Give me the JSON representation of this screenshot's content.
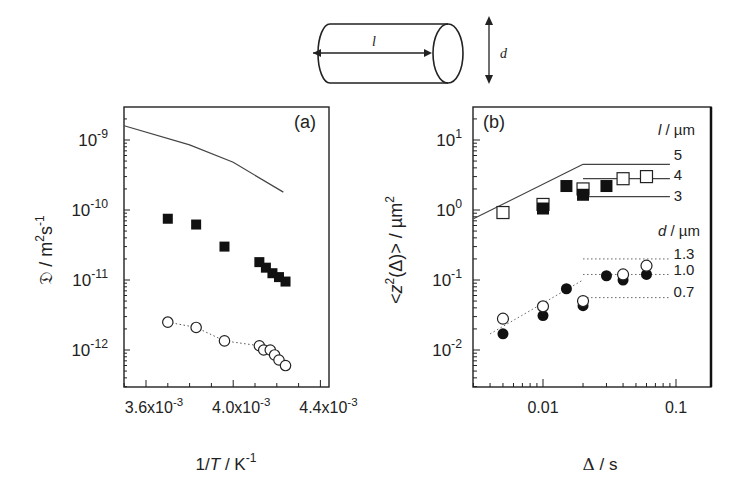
{
  "figure": {
    "schematic": {
      "length_label": "l",
      "diameter_label": "d"
    },
    "panel_a": {
      "label": "(a)",
      "ylabel_symbol": "𝔇",
      "ylabel_unit": "/ m²s⁻¹",
      "xlabel": "1/T / K⁻¹",
      "yticks": [
        "10-9",
        "10-10",
        "10-11",
        "10-12"
      ],
      "xticks": [
        "3.6x10-3",
        "4.0x10-3",
        "4.4x10-3"
      ]
    },
    "panel_b": {
      "label": "(b)",
      "ylabel": "<z²(Δ)> / µm²",
      "xlabel": "Δ / s",
      "yticks": [
        "10^1",
        "10^0",
        "10^-1",
        "10^-2"
      ],
      "xticks": [
        "0.01",
        "0.1"
      ],
      "legend_l_title": "l / µm",
      "legend_l_values": [
        "5",
        "4",
        "3"
      ],
      "legend_d_title": "d / µm",
      "legend_d_values": [
        "1.3",
        "1.0",
        "0.7"
      ]
    }
  },
  "chart_data": [
    {
      "type": "scatter",
      "title": "(a)",
      "xlabel": "1/T / K^-1",
      "ylabel": "D / m^2 s^-1",
      "xscale": "linear",
      "yscale": "log",
      "xlim": [
        0.0035,
        0.00443
      ],
      "ylim": [
        3e-13,
        3e-09
      ],
      "xticks": [
        0.0036,
        0.004,
        0.0044
      ],
      "yticks": [
        1e-09,
        1e-10,
        1e-11,
        1e-12
      ],
      "series": [
        {
          "name": "theory (solid line)",
          "style": "line",
          "x": [
            0.0035,
            0.0038,
            0.004,
            0.00423
          ],
          "y": [
            1.6e-09,
            8.5e-10,
            4.8e-10,
            1.8e-10
          ]
        },
        {
          "name": "filled squares",
          "style": "filled-square",
          "x": [
            0.0037,
            0.00383,
            0.00396,
            0.00412,
            0.00415,
            0.00418,
            0.00421,
            0.00424
          ],
          "y": [
            7.5e-11,
            6.2e-11,
            3e-11,
            1.8e-11,
            1.5e-11,
            1.25e-11,
            1.1e-11,
            9.5e-12
          ]
        },
        {
          "name": "open circles (dotted fit)",
          "style": "open-circle",
          "x": [
            0.0037,
            0.00383,
            0.00396,
            0.00412,
            0.00414,
            0.00417,
            0.00419,
            0.00421,
            0.00424
          ],
          "y": [
            2.5e-12,
            2.1e-12,
            1.35e-12,
            1.15e-12,
            1e-12,
            1e-12,
            8.5e-13,
            7.2e-13,
            6e-13
          ]
        }
      ]
    },
    {
      "type": "scatter",
      "title": "(b)",
      "xlabel": "Δ / s",
      "ylabel": "<z^2(Δ)> / µm^2",
      "xscale": "log",
      "yscale": "log",
      "xlim": [
        0.003,
        0.18
      ],
      "ylim": [
        0.0035,
        30
      ],
      "xticks": [
        0.01,
        0.1
      ],
      "yticks": [
        10,
        1,
        0.1,
        0.01
      ],
      "series": [
        {
          "name": "open squares",
          "style": "open-square",
          "x": [
            0.005,
            0.01,
            0.02,
            0.04,
            0.06
          ],
          "y": [
            0.92,
            1.2,
            2.0,
            2.8,
            3.0
          ]
        },
        {
          "name": "filled squares",
          "style": "filled-square",
          "x": [
            0.01,
            0.015,
            0.02,
            0.03
          ],
          "y": [
            1.05,
            2.2,
            1.65,
            2.2
          ]
        },
        {
          "name": "open circles",
          "style": "open-circle",
          "x": [
            0.005,
            0.01,
            0.02,
            0.04,
            0.06
          ],
          "y": [
            0.028,
            0.042,
            0.05,
            0.12,
            0.16
          ]
        },
        {
          "name": "filled circles",
          "style": "filled-circle",
          "x": [
            0.005,
            0.01,
            0.015,
            0.02,
            0.03,
            0.04,
            0.06
          ],
          "y": [
            0.017,
            0.031,
            0.075,
            0.043,
            0.115,
            0.1,
            0.12
          ]
        },
        {
          "name": "theory l (solid)",
          "style": "line",
          "x": [
            0.003,
            0.02
          ],
          "y": [
            0.75,
            4.5
          ]
        },
        {
          "name": "l = 5 µm plateau",
          "style": "line",
          "x": [
            0.02,
            0.09
          ],
          "y": [
            4.5,
            4.5
          ]
        },
        {
          "name": "l = 4 µm plateau",
          "style": "line",
          "x": [
            0.02,
            0.09
          ],
          "y": [
            2.8,
            2.8
          ]
        },
        {
          "name": "l = 3 µm plateau",
          "style": "line",
          "x": [
            0.02,
            0.09
          ],
          "y": [
            1.55,
            1.55
          ]
        },
        {
          "name": "theory d (dotted)",
          "style": "dotted",
          "x": [
            0.004,
            0.02
          ],
          "y": [
            0.017,
            0.1
          ]
        },
        {
          "name": "d = 1.3 µm plateau",
          "style": "dotted",
          "x": [
            0.02,
            0.09
          ],
          "y": [
            0.2,
            0.2
          ]
        },
        {
          "name": "d = 1.0 µm plateau",
          "style": "dotted",
          "x": [
            0.02,
            0.09
          ],
          "y": [
            0.12,
            0.12
          ]
        },
        {
          "name": "d = 0.7 µm plateau",
          "style": "dotted",
          "x": [
            0.02,
            0.09
          ],
          "y": [
            0.056,
            0.056
          ]
        }
      ],
      "legend": {
        "l_values_um": [
          5,
          4,
          3
        ],
        "d_values_um": [
          1.3,
          1.0,
          0.7
        ]
      }
    }
  ]
}
